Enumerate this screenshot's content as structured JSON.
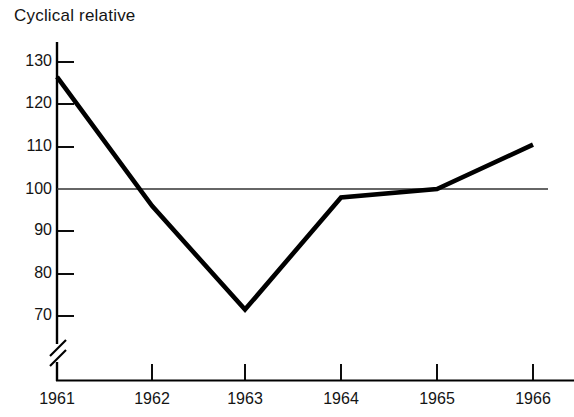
{
  "chart_data": {
    "type": "line",
    "title": "Cyclical relative",
    "xlabel": "",
    "ylabel": "",
    "categories": [
      "1961",
      "1962",
      "1963",
      "1964",
      "1965",
      "1966"
    ],
    "x": [
      1961,
      1962,
      1963,
      1964,
      1965,
      1966
    ],
    "values": [
      126.5,
      96,
      71.5,
      98,
      100,
      110.5
    ],
    "series": [
      {
        "name": "Cyclical relative",
        "values": [
          126.5,
          96,
          71.5,
          98,
          100,
          110.5
        ]
      }
    ],
    "ylim": [
      66,
      132
    ],
    "yticks": [
      70,
      80,
      90,
      100,
      110,
      120,
      130
    ],
    "ytick_labels": [
      "70",
      "80",
      "90",
      "100",
      "110",
      "120",
      "130"
    ],
    "xticks": [
      1961,
      1962,
      1963,
      1964,
      1965,
      1966
    ],
    "xtick_labels": [
      "1961",
      "1962",
      "1963",
      "1964",
      "1965",
      "1966"
    ],
    "grid": false,
    "legend": false,
    "axis_break": true,
    "axis_break_note": "y-axis broken below 70",
    "reference_line": {
      "value": 100,
      "label": "100"
    },
    "line_color": "#000000",
    "reference_line_color": "#333333",
    "axis_color": "#000000",
    "background_color": "#ffffff"
  }
}
